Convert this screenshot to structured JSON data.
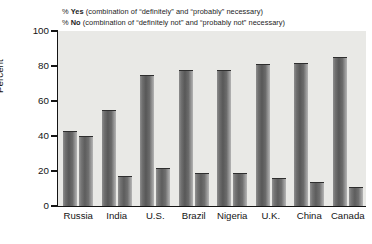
{
  "legend": {
    "line1": {
      "pct": "% ",
      "key": "Yes",
      "rest": " (combination of “definitely” and “probably” necessary)"
    },
    "line2": {
      "pct": "% ",
      "key": "No",
      "rest": " (combination of “definitely not” and “probably not” necessary)"
    }
  },
  "chart_data": {
    "type": "bar",
    "title": "",
    "xlabel": "",
    "ylabel": "Percent",
    "ylim": [
      0,
      100
    ],
    "yticks": [
      "0",
      "20",
      "40",
      "60",
      "80",
      "100"
    ],
    "grid": false,
    "legend_position": "top",
    "categories": [
      "Russia",
      "India",
      "U.S.",
      "Brazil",
      "Nigeria",
      "U.K.",
      "China",
      "Canada"
    ],
    "series": [
      {
        "name": "% Yes",
        "color": "#6e6e6e",
        "values": [
          43,
          55,
          75,
          78,
          78,
          81,
          82,
          85
        ]
      },
      {
        "name": "% No",
        "color": "#737373",
        "values": [
          40,
          17,
          22,
          19,
          19,
          16,
          14,
          11
        ]
      }
    ]
  },
  "colors": {
    "plot_background": "#e9e9e6",
    "axis": "#141414",
    "bar_yes": "#6e6e6e",
    "bar_no": "#737373",
    "text": "#1c1c1c"
  }
}
